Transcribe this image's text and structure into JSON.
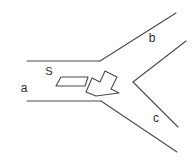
{
  "diagram": {
    "canvas": {
      "width": 193,
      "height": 162,
      "background": "#ffffff"
    },
    "stroke_color": "#4a4a4a",
    "text_color": "#2b2b2b",
    "labels": {
      "branch_a": "a",
      "branch_b": "b",
      "branch_c": "c",
      "vessel": "S"
    },
    "label_positions": {
      "branch_a": {
        "x": 24,
        "y": 92
      },
      "branch_b": {
        "x": 152,
        "y": 42
      },
      "branch_c": {
        "x": 156,
        "y": 122
      },
      "vessel": {
        "x": 49,
        "y": 75
      }
    },
    "geometry": {
      "channel_a_top": "M 27,61 L 100,61",
      "channel_a_bottom": "M 27,101 L 101,101",
      "branch_b_upper_wall": "M 100,61 L 176,13",
      "branch_b_lower_wall": "M 133,82 L 186,41",
      "branch_c_upper_wall": "M 133,82 L 178,127",
      "branch_c_lower_wall": "M 101,101 L 177,152",
      "vessel_shape": "M 56,86 L 61,77 L 88,77 L 85,86 Z",
      "arrow_shape": "M 86,92 L 92,78 L 100,82 L 105,71 L 117,77 L 111,89 L 119,93 L 96,96 Z"
    },
    "elements": {
      "vessel_name": "vessel-symbol",
      "arrow_name": "direction-arrow",
      "arrow_direction": "up-right"
    }
  }
}
